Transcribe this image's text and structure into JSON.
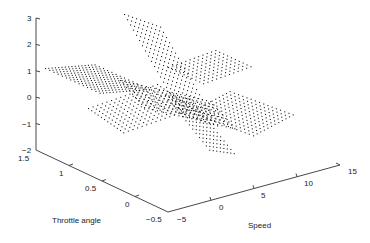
{
  "chart_data": {
    "type": "scatter3d",
    "title": "",
    "xlabel": "Speed",
    "ylabel": "Throttle angle",
    "zlabel": "",
    "xlim": [
      -5,
      15
    ],
    "ylim": [
      -0.5,
      1.5
    ],
    "zlim": [
      -2,
      3
    ],
    "grid": false,
    "legend": null,
    "ticks": {
      "z": [
        "-2",
        "-1",
        "0",
        "1",
        "2",
        "3"
      ],
      "throttle": [
        "1.5",
        "1",
        "0.5",
        "0",
        "-0.5"
      ],
      "speed": [
        "-5",
        "0",
        "5",
        "10",
        "15"
      ]
    },
    "patches": [
      {
        "name": "left-plane",
        "ox": 45,
        "oy": 68,
        "ux": 4.2,
        "uy": 1.9,
        "vx": 3.3,
        "vy": -0.25,
        "nu": 14,
        "nv": 16
      },
      {
        "name": "upper-steep-plane",
        "ox": 124,
        "oy": 14,
        "ux": 3.0,
        "uy": 5.2,
        "vx": 4.0,
        "vy": 1.4,
        "nu": 20,
        "nv": 10
      },
      {
        "name": "upper-right-plane",
        "ox": 168,
        "oy": 67,
        "ux": 3.9,
        "uy": 1.8,
        "vx": 4.3,
        "vy": -1.55,
        "nu": 10,
        "nv": 12
      },
      {
        "name": "mid-cross-plane",
        "ox": 120,
        "oy": 80,
        "ux": 4.3,
        "uy": 1.0,
        "vx": 3.0,
        "vy": 3.4,
        "nu": 22,
        "nv": 9
      },
      {
        "name": "lower-left-plane",
        "ox": 88,
        "oy": 108,
        "ux": 4.6,
        "uy": -1.6,
        "vx": 3.2,
        "vy": 2.2,
        "nu": 16,
        "nv": 12
      },
      {
        "name": "lower-right-plane",
        "ox": 190,
        "oy": 112,
        "ux": 4.2,
        "uy": 1.55,
        "vx": 3.6,
        "vy": -1.9,
        "nu": 16,
        "nv": 12
      },
      {
        "name": "falling-plane",
        "ox": 165,
        "oy": 95,
        "ux": 3.4,
        "uy": 4.2,
        "vx": 3.5,
        "vy": 0.5,
        "nu": 14,
        "nv": 8
      }
    ]
  },
  "axes": {
    "z_labels": [
      {
        "text": "3",
        "x": 27,
        "y": 21
      },
      {
        "text": "2",
        "x": 27,
        "y": 47
      },
      {
        "text": "1",
        "x": 27,
        "y": 74
      },
      {
        "text": "0",
        "x": 27,
        "y": 100
      },
      {
        "text": "−1",
        "x": 22,
        "y": 127
      },
      {
        "text": "−2",
        "x": 22,
        "y": 153
      }
    ],
    "throttle_labels": [
      {
        "text": "1.5",
        "x": 18,
        "y": 161
      },
      {
        "text": "1",
        "x": 59,
        "y": 176
      },
      {
        "text": "0.5",
        "x": 85,
        "y": 191
      },
      {
        "text": "0",
        "x": 125,
        "y": 207
      },
      {
        "text": "−0.5",
        "x": 146,
        "y": 222
      }
    ],
    "speed_labels": [
      {
        "text": "−5",
        "x": 177,
        "y": 222
      },
      {
        "text": "0",
        "x": 219,
        "y": 210
      },
      {
        "text": "5",
        "x": 261,
        "y": 198
      },
      {
        "text": "10",
        "x": 304,
        "y": 186
      },
      {
        "text": "15",
        "x": 348,
        "y": 174
      }
    ],
    "throttle_title": {
      "text": "Throttle angle",
      "x": 52,
      "y": 223
    },
    "speed_title": {
      "text": "Speed",
      "x": 248,
      "y": 228
    }
  }
}
